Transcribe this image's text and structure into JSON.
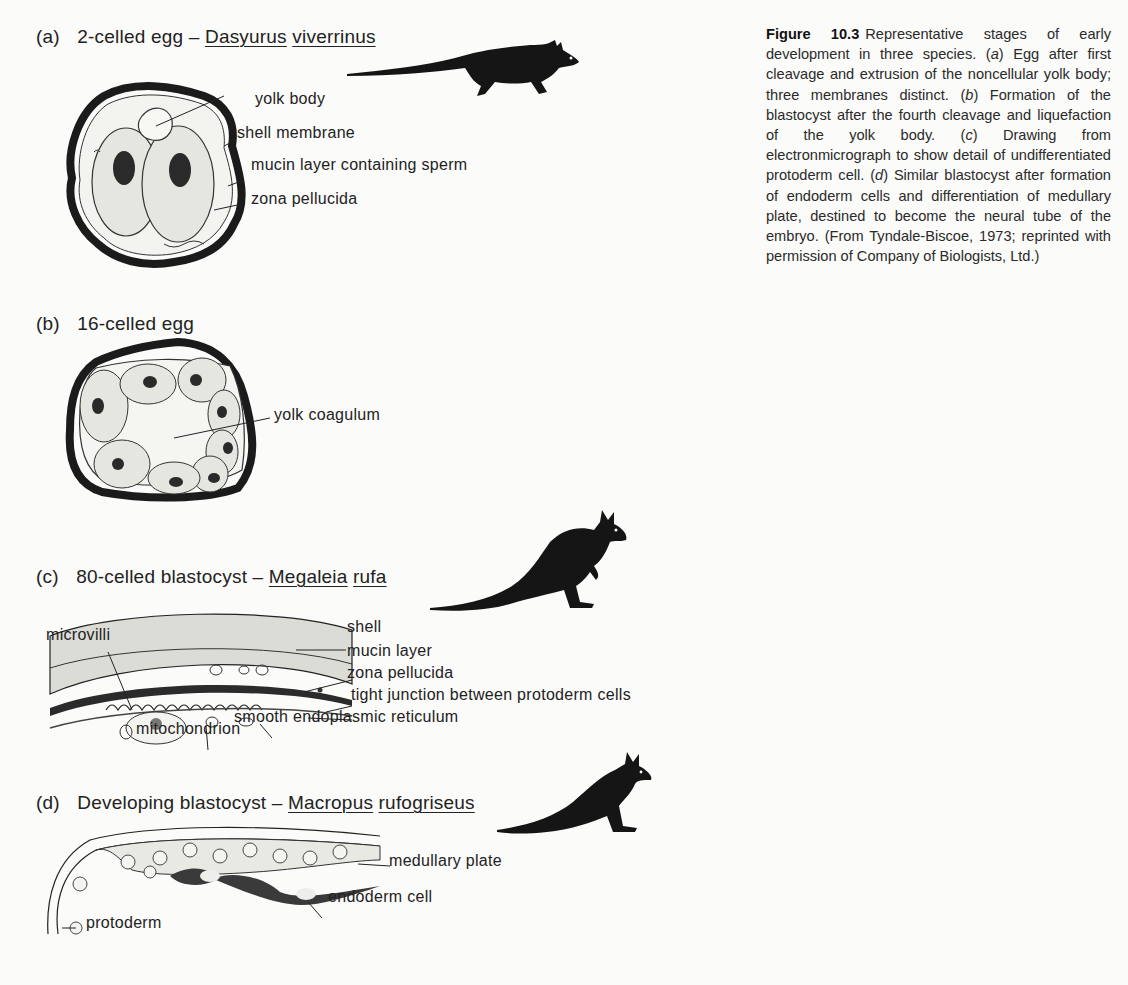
{
  "figure": {
    "number": "Figure 10.3",
    "caption": "Representative stages of early development in three species. (a) Egg after first cleavage and extrusion of the noncellular yolk body; three membranes distinct. (b) Formation of the blastocyst after the fourth cleavage and liquefaction of the yolk body. (c) Drawing from electronmicrograph to show detail of undifferentiated protoderm cell. (d) Similar blastocyst after formation of endoderm cells and differentiation of medullary plate, destined to become the neural tube of the embryo. (From Tyndale-Biscoe, 1973; reprinted with permission of Company of Biologists, Ltd.)",
    "caption_parts": [
      "Representative stages of early development in three species. (",
      "a",
      ") Egg after first cleavage and extrusion of the noncellular yolk body; three membranes distinct. (",
      "b",
      ") Formation of the blastocyst after the fourth cleavage and liquefaction of the yolk body. (",
      "c",
      ") Drawing from electronmicrograph to show detail of undifferentiated protoderm cell. (",
      "d",
      ") Similar blastocyst after formation of endoderm cells and differentiation of medullary plate, destined to become the neural tube of the embryo. (From Tyndale-Biscoe, 1973; reprinted with permission of Company of Biologists, Ltd.)"
    ]
  },
  "panels": {
    "a": {
      "letter": "(a)",
      "stage": "2-celled egg –",
      "genus": "Dasyurus",
      "species": "viverrinus",
      "animal_icon": "quoll-silhouette-icon",
      "labels": [
        "yolk body",
        "shell membrane",
        "mucin layer containing sperm",
        "zona pellucida"
      ]
    },
    "b": {
      "letter": "(b)",
      "stage": "16-celled egg",
      "labels": [
        "yolk coagulum"
      ]
    },
    "c": {
      "letter": "(c)",
      "stage": "80-celled blastocyst –",
      "genus": "Megaleia",
      "species": "rufa",
      "animal_icon": "kangaroo-silhouette-icon",
      "labels": [
        "shell",
        "mucin layer",
        "zona pellucida",
        "tight junction between protoderm cells",
        "smooth endoplasmic reticulum",
        "mitochondrion",
        "microvilli"
      ]
    },
    "d": {
      "letter": "(d)",
      "stage": "Developing blastocyst –",
      "genus": "Macropus",
      "species": "rufogriseus",
      "animal_icon": "wallaby-silhouette-icon",
      "labels": [
        "medullary plate",
        "endoderm cell",
        "protoderm"
      ]
    }
  },
  "colors": {
    "ink": "#1b1b1b",
    "paper": "#fbfbf9",
    "stipple": "#d6d6d0"
  }
}
